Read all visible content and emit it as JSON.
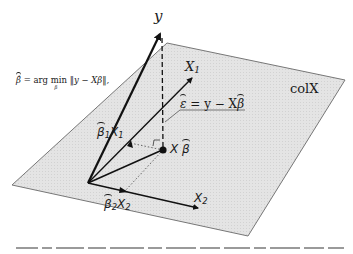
{
  "formula": {
    "text": "β̂ = arg min ‖y − Xβ‖,",
    "lhs": "β̂",
    "eq": "=",
    "op": "arg min",
    "op_sub": "β",
    "rhs": "‖y − Xβ‖,"
  },
  "labels": {
    "y": "y",
    "x1_axis": "X",
    "x1_sub": "1",
    "x2_axis": "X",
    "x2_sub": "2",
    "plane": "colX",
    "residual": "ε = y − Xβ",
    "residual_eps": "ε",
    "residual_rest": " = y − X",
    "residual_beta": "β",
    "fitted_x": "X",
    "fitted_beta": "β",
    "b1x1_beta": "β",
    "b1x1_sub": "1",
    "b1x1_x": "X",
    "b1x1_xsub": "1",
    "b2x2_beta": "β",
    "b2x2_sub": "2",
    "b2x2_x": "X",
    "b2x2_xsub": "2"
  },
  "caption": "(blurred caption text, illegible)",
  "colors": {
    "plane_fill": "#e2e2e2",
    "plane_edge": "#777777",
    "ink": "#111111",
    "background": "#ffffff"
  }
}
